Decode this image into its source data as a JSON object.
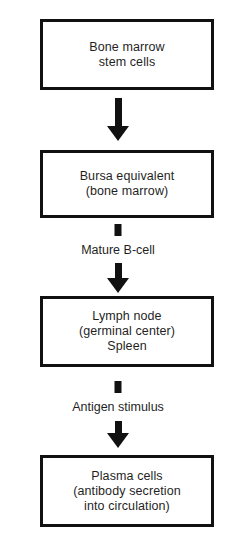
{
  "diagram": {
    "orientation": "vertical",
    "colors": {
      "background": "#ffffff",
      "box_border": "#111111",
      "box_fill": "#ffffff",
      "text": "#1f1f1f",
      "arrow": "#111111"
    },
    "nodes": [
      {
        "id": "stem",
        "label": "Bone marrow\nstem cells",
        "lines": [
          "Bone marrow",
          "stem cells"
        ]
      },
      {
        "id": "bursa",
        "label": "Bursa equivalent\n(bone marrow)",
        "lines": [
          "Bursa equivalent",
          "(bone marrow)"
        ]
      },
      {
        "id": "lymph",
        "label": "Lymph node\n(germinal center)\nSpleen",
        "lines": [
          "Lymph node",
          "(germinal center)",
          "Spleen"
        ]
      },
      {
        "id": "plasma",
        "label": "Plasma cells\n(antibody secretion\ninto circulation)",
        "lines": [
          "Plasma cells",
          "(antibody secretion",
          "into circulation)"
        ]
      }
    ],
    "edges": [
      {
        "id": "e1",
        "from": "stem",
        "to": "bursa",
        "label": "",
        "arrow": "down-arrow-icon"
      },
      {
        "id": "e2",
        "from": "bursa",
        "to": "lymph",
        "label": "Mature B-cell",
        "arrow": "down-arrow-icon"
      },
      {
        "id": "e3",
        "from": "lymph",
        "to": "plasma",
        "label": "Antigen stimulus",
        "arrow": "down-arrow-icon"
      }
    ]
  }
}
